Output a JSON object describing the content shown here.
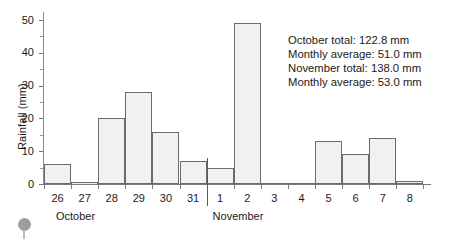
{
  "chart_data": {
    "type": "bar",
    "title": "",
    "xlabel": "",
    "ylabel": "Rainfall (mm)",
    "ylim": [
      0,
      55
    ],
    "yticks": [
      0,
      10,
      20,
      30,
      40,
      50
    ],
    "grid": false,
    "legend": "none",
    "categories": [
      "26",
      "27",
      "28",
      "29",
      "30",
      "31",
      "1",
      "2",
      "3",
      "4",
      "5",
      "6",
      "7",
      "8"
    ],
    "months": [
      "October",
      "October",
      "October",
      "October",
      "October",
      "October",
      "November",
      "November",
      "November",
      "November",
      "November",
      "November",
      "November",
      "November"
    ],
    "values": [
      6,
      0.5,
      20,
      28,
      16,
      7,
      5,
      49,
      0,
      0,
      13,
      9,
      14,
      1
    ],
    "month_divider_after_category": "31",
    "bar_fill_color": "#f1f1f1",
    "bar_edge_color": "#6b6b6b"
  },
  "axis": {
    "y_title": "Rainfall (mm)",
    "y_labels": [
      "50",
      "40",
      "30",
      "20",
      "10",
      "0"
    ],
    "x_labels": [
      "26",
      "27",
      "28",
      "29",
      "30",
      "31",
      "1",
      "2",
      "3",
      "4",
      "5",
      "6",
      "7",
      "8"
    ]
  },
  "months": {
    "first": "October",
    "second": "November"
  },
  "annotation": {
    "line1": "October total: 122.8 mm",
    "line2": "Monthly average: 51.0 mm",
    "line3": "November total: 138.0 mm",
    "line4": "Monthly average: 53.0 mm"
  },
  "decoration": {
    "pin_color": "#9e9e9e"
  }
}
